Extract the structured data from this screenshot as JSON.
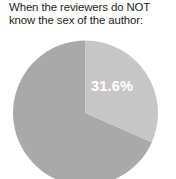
{
  "figure": {
    "background_color": "#ffffff",
    "title": "When the reviewers do NOT\nknow the sex of the author:"
  },
  "chart_data": {
    "type": "pie",
    "title": "When the reviewers do NOT know the sex of the author:",
    "categories": [
      "Highlighted share",
      "Remainder"
    ],
    "values": [
      31.6,
      68.4
    ],
    "value_unit": "%",
    "labels": [
      "31.6%",
      ""
    ],
    "colors": [
      "#c6c6c6",
      "#a9a9a9"
    ],
    "start_angle_deg": 0,
    "direction": "clockwise",
    "legend": "none",
    "grid": false
  },
  "slices": [
    {
      "name": "highlighted-slice",
      "label": "31.6%",
      "value": 31.6,
      "color": "#c6c6c6",
      "label_x": 112,
      "label_y": 86
    },
    {
      "name": "remainder-slice",
      "label": "",
      "value": 68.4,
      "color": "#a9a9a9"
    }
  ]
}
